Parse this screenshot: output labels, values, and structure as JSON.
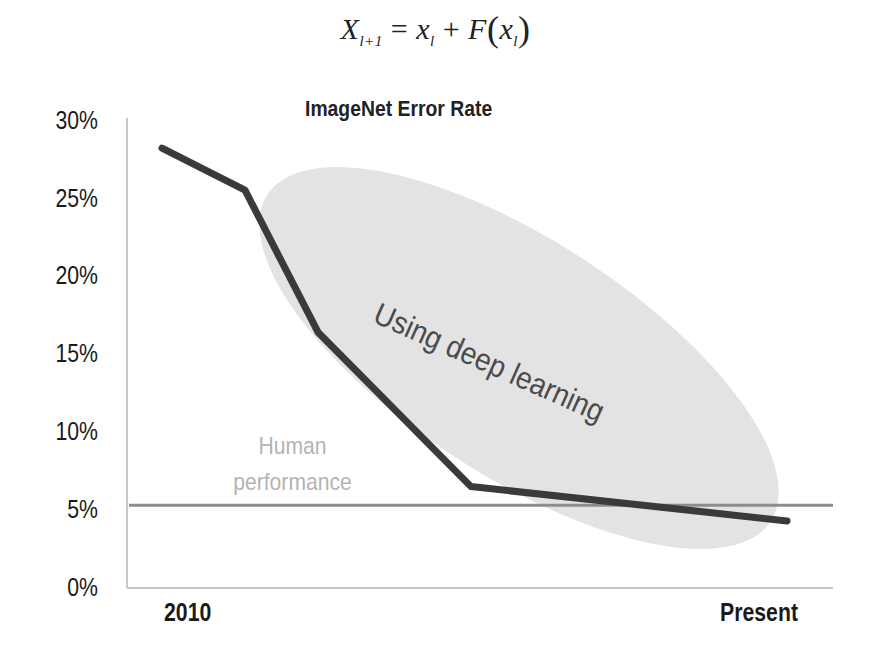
{
  "formula": {
    "lhs": "X",
    "lhs_sub": "l+1",
    "eq": "=",
    "x1": "x",
    "x1_sub": "l",
    "plus": "+",
    "F": "F",
    "lparen": "(",
    "x2": "x",
    "x2_sub": "l",
    "rparen": ")"
  },
  "chart": {
    "title": "ImageNet Error Rate",
    "y_ticks": [
      "30%",
      "25%",
      "20%",
      "15%",
      "10%",
      "5%",
      "0%"
    ],
    "x_ticks": [
      "2010",
      "Present"
    ],
    "human_label_line1": "Human",
    "human_label_line2": "performance",
    "annotation": "Using deep learning",
    "colors": {
      "line": "#3a3a3a",
      "human_line": "#8c8c8c",
      "ellipse": "#e3e3e3",
      "axis": "#c8c8c8",
      "human_label": "#b3b3b3"
    }
  },
  "chart_data": {
    "type": "line",
    "title": "ImageNet Error Rate",
    "xlabel": "",
    "ylabel": "",
    "x": [
      "2010",
      "2011",
      "2012",
      "2014",
      "Present"
    ],
    "x_tick_labels": [
      "2010",
      "Present"
    ],
    "series": [
      {
        "name": "ImageNet top-5 error rate",
        "values": [
          28.2,
          25.5,
          16.4,
          6.5,
          4.3
        ]
      }
    ],
    "reference_lines": [
      {
        "name": "Human performance",
        "y": 5.3
      }
    ],
    "annotations": [
      {
        "text": "Using deep learning",
        "shape": "ellipse",
        "covers_x": [
          "2011",
          "Present"
        ]
      },
      {
        "text": "Human performance",
        "position": "above reference line"
      }
    ],
    "ylim": [
      0,
      30
    ],
    "y_ticks": [
      0,
      5,
      10,
      15,
      20,
      25,
      30
    ],
    "y_tick_format": "percent",
    "grid": false,
    "legend": "none"
  }
}
